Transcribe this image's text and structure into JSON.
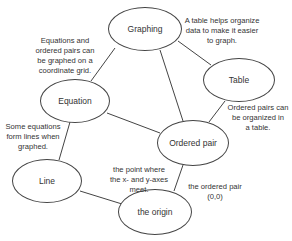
{
  "nodes": {
    "graphing": "Graphing",
    "table": "Table",
    "equation": "Equation",
    "ordered_pair": "Ordered pair",
    "line": "Line",
    "origin": "the origin"
  },
  "notes": {
    "table_note": [
      "A table helps organize",
      "data to make it easier",
      "to graph."
    ],
    "equation_note": [
      "Equations and",
      "ordered pairs can",
      "be graphed on a",
      "coordinate grid."
    ],
    "ordered_pair_note": [
      "Ordered pairs can",
      "be organized in",
      "a table."
    ],
    "line_note": [
      "Some equations",
      "form lines when",
      "graphed."
    ],
    "origin_left_note": [
      "the point where",
      "the x- and y-axes",
      "meet."
    ],
    "origin_right_note": [
      "the ordered pair",
      "(0,0)"
    ]
  },
  "edges": [
    [
      "graphing",
      "equation"
    ],
    [
      "graphing",
      "table"
    ],
    [
      "graphing",
      "ordered_pair"
    ],
    [
      "equation",
      "ordered_pair"
    ],
    [
      "table",
      "ordered_pair"
    ],
    [
      "equation",
      "line"
    ],
    [
      "line",
      "origin"
    ],
    [
      "ordered_pair",
      "origin"
    ]
  ]
}
